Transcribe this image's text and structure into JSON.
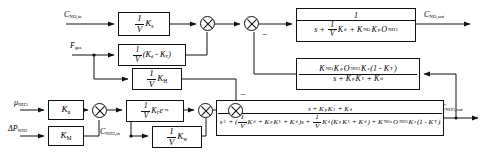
{
  "diagram": {
    "type": "control-system-block-diagram",
    "canvas": {
      "width": 487,
      "height": 154
    },
    "stroke_color": "#111111",
    "background_color": "#ffffff"
  },
  "signals": {
    "c_no_in": {
      "label": "C",
      "sub": "NO,in",
      "x": 64,
      "y": 12
    },
    "f_gas": {
      "label": "F",
      "sub": "gas",
      "x": 70,
      "y": 41
    },
    "mu_nh3": {
      "label": "μ",
      "sub": "NH3",
      "x": 14,
      "y": 100
    },
    "dp_nh3": {
      "label": "ΔP",
      "sub": "NH3",
      "x": 8,
      "y": 126
    },
    "c_nh3_in": {
      "label": "C",
      "sub": "NH3,in",
      "x": 130,
      "y": 126
    },
    "c_no_out": {
      "label": "C",
      "sub": "NO,out",
      "x": 390,
      "y": 12
    },
    "c_nh3_out": {
      "label": "C",
      "sub": "NH3,out",
      "x": 438,
      "y": 96
    }
  },
  "blocks": {
    "gain_ks": {
      "name": "gain-1-over-V-Ks",
      "numerator": "1",
      "denominator": "V",
      "trailing": "K",
      "trailing_sub": "s",
      "x": 118,
      "y": 12,
      "w": 52,
      "h": 24
    },
    "gain_kd_minus_kt": {
      "name": "gain-1-over-V-Kd-minus-KT",
      "numerator": "1",
      "denominator": "V",
      "trailing": "(K",
      "trailing_sub": "d",
      "tail": " - K",
      "tail_sub": "T",
      "tail_end": ")",
      "x": 118,
      "y": 44,
      "w": 68,
      "h": 22
    },
    "gain_kh": {
      "name": "gain-1-over-V-KH",
      "numerator": "1",
      "denominator": "V",
      "trailing": "K",
      "trailing_sub": "H",
      "x": 132,
      "y": 68,
      "w": 50,
      "h": 22
    },
    "gain_ku": {
      "name": "gain-Ku",
      "label": "K",
      "label_sub": "u",
      "x": 48,
      "y": 100,
      "w": 36,
      "h": 20
    },
    "gain_km": {
      "name": "gain-Km",
      "label": "K",
      "label_sub": "M",
      "x": 48,
      "y": 126,
      "w": 36,
      "h": 20
    },
    "gain_kf_delay": {
      "name": "gain-1-over-V-KF-delay",
      "numerator": "1",
      "denominator": "V",
      "trailing": "K",
      "trailing_sub": "F",
      "exp": "e",
      "exp_sup": "-τs",
      "x": 126,
      "y": 100,
      "w": 58,
      "h": 22
    },
    "gain_kw": {
      "name": "gain-1-over-V-Kw",
      "numerator": "1",
      "denominator": "V",
      "trailing": "K",
      "trailing_sub": "w",
      "x": 152,
      "y": 126,
      "w": 50,
      "h": 22
    },
    "tf_no_plant": {
      "name": "transfer-function-no-plant",
      "numerator": "1",
      "denominator_parts": [
        {
          "t": "s + "
        },
        {
          "frac_num": "1",
          "frac_den": "V"
        },
        {
          "t": "K",
          "sub": "d"
        },
        {
          "t": " + K",
          "sub": "NO"
        },
        {
          "t": "K",
          "sub": "p"
        },
        {
          "t": "O",
          "sub": "NH3"
        }
      ],
      "x": 296,
      "y": 8,
      "w": 120,
      "h": 34
    },
    "tf_feedback": {
      "name": "transfer-function-feedback-coupling",
      "numerator_parts": [
        {
          "t": "K",
          "sub": "NO"
        },
        {
          "t": "K",
          "sub": "p"
        },
        {
          "t": "O",
          "sub": "NH3"
        },
        {
          "t": "K",
          "sub": "s"
        },
        {
          "t": "(1 - K",
          "sub": "T"
        },
        {
          "t": ")"
        }
      ],
      "denominator_parts": [
        {
          "t": "s + K",
          "sub": "p"
        },
        {
          "t": "K",
          "sub": "I"
        },
        {
          "t": " + K",
          "sub": "d"
        }
      ],
      "x": 296,
      "y": 58,
      "w": 124,
      "h": 32
    },
    "tf_nh3_plant": {
      "name": "transfer-function-nh3-plant",
      "numerator_parts": [
        {
          "t": "s + K",
          "sub": "p"
        },
        {
          "t": "K",
          "sub": "I"
        },
        {
          "t": " + K",
          "sub": "d"
        }
      ],
      "denominator_parts": [
        {
          "t": "s",
          "sup": "2"
        },
        {
          "t": " + ("
        },
        {
          "frac_num": "1",
          "frac_den": "V"
        },
        {
          "t": "K",
          "sub": "d"
        },
        {
          "t": " + K",
          "sub": "p"
        },
        {
          "t": "K",
          "sub": "I"
        },
        {
          "t": " + K",
          "sub": "d"
        },
        {
          "t": ")s + "
        },
        {
          "frac_num": "1",
          "frac_den": "V"
        },
        {
          "t": "K",
          "sub": "d"
        },
        {
          "t": "(K",
          "sub": "p"
        },
        {
          "t": "K",
          "sub": "I"
        },
        {
          "t": " + K",
          "sub": "d"
        },
        {
          "t": ") + K",
          "sub": "NOx"
        },
        {
          "t": "O",
          "sub": "NH3"
        },
        {
          "t": "K",
          "sub": "s"
        },
        {
          "t": "(1 - K",
          "sub": "T"
        },
        {
          "t": ")"
        }
      ],
      "x": 216,
      "y": 100,
      "w": 228,
      "h": 36
    }
  },
  "sum_junctions": [
    {
      "name": "sum-junction-top-left",
      "x": 200,
      "y": 16,
      "d": 15,
      "signs": []
    },
    {
      "name": "sum-junction-top-right",
      "x": 244,
      "y": 16,
      "d": 15,
      "signs": [
        {
          "text": "−",
          "x": 262,
          "y": 33
        }
      ]
    },
    {
      "name": "sum-junction-bottom-mid",
      "x": 198,
      "y": 104,
      "d": 15,
      "signs": []
    },
    {
      "name": "sum-junction-bottom-right",
      "x": 228,
      "y": 104,
      "d": 15,
      "signs": [
        {
          "text": "−",
          "x": 243,
          "y": 92
        }
      ]
    },
    {
      "name": "sum-junction-bottom-left",
      "x": 92,
      "y": 104,
      "d": 15,
      "signs": []
    }
  ],
  "connections": {
    "description": "Signal wires connecting blocks, summing junctions and IO ports",
    "count": 24
  }
}
